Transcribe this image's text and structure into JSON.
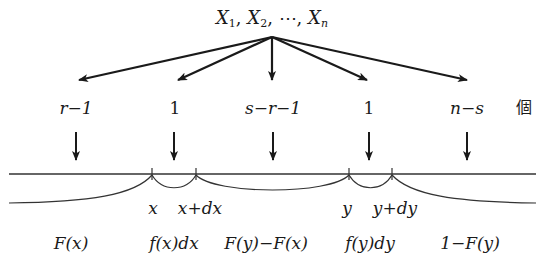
{
  "title": {
    "variables": [
      {
        "base": "X",
        "sub": "1"
      },
      {
        "base": "X",
        "sub": "2"
      },
      {
        "base": "X",
        "sub": "n"
      }
    ],
    "ellipsis": "⋯",
    "text": "X1, X2, ⋯, Xn"
  },
  "counts": {
    "items": [
      {
        "label": "r−1",
        "x": 76
      },
      {
        "label": "1",
        "x": 175
      },
      {
        "label": "s−r−1",
        "x": 273
      },
      {
        "label": "1",
        "x": 369
      },
      {
        "label": "n−s",
        "x": 467
      }
    ],
    "unit_label": "個"
  },
  "axis": {
    "points": [
      {
        "label": "x",
        "x": 152
      },
      {
        "label": "x+dx",
        "x": 196
      },
      {
        "label": "y",
        "x": 349
      },
      {
        "label": "y+dy",
        "x": 392
      }
    ]
  },
  "probabilities": [
    {
      "label": "F(x)",
      "x": 71
    },
    {
      "label": "f(x)dx",
      "x": 174
    },
    {
      "label": "F(y)−F(x)",
      "x": 266
    },
    {
      "label": "f(y)dy",
      "x": 370
    },
    {
      "label": "1−F(y)",
      "x": 470
    }
  ],
  "colors": {
    "ink": "#1a1a1a",
    "line": "#333333"
  }
}
